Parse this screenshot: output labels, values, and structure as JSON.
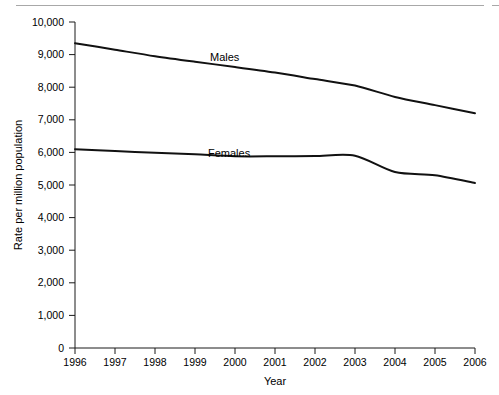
{
  "chart_data": {
    "type": "line",
    "title": "",
    "xlabel": "Year",
    "ylabel": "Rate per million population",
    "x": [
      1996,
      1997,
      1998,
      1999,
      2000,
      2001,
      2002,
      2003,
      2004,
      2005,
      2006
    ],
    "xlim": [
      1996,
      2006
    ],
    "ylim": [
      0,
      10000
    ],
    "ytick_labels": [
      "0",
      "1,000",
      "2,000",
      "3,000",
      "4,000",
      "5,000",
      "6,000",
      "7,000",
      "8,000",
      "9,000",
      "10,000"
    ],
    "ytick_values": [
      0,
      1000,
      2000,
      3000,
      4000,
      5000,
      6000,
      7000,
      8000,
      9000,
      10000
    ],
    "xtick_labels": [
      "1996",
      "1997",
      "1998",
      "1999",
      "2000",
      "2001",
      "2002",
      "2003",
      "2004",
      "2005",
      "2006"
    ],
    "grid": false,
    "legend_position": "inline-labels",
    "series": [
      {
        "name": "Males",
        "label": "Males",
        "values": [
          9350,
          9150,
          8950,
          8780,
          8620,
          8450,
          8250,
          8050,
          7700,
          7450,
          7200
        ]
      },
      {
        "name": "Females",
        "label": "Females",
        "values": [
          6100,
          6040,
          5990,
          5940,
          5880,
          5880,
          5890,
          5900,
          5400,
          5300,
          5060
        ]
      }
    ],
    "annotations": [
      {
        "text": "Males",
        "x": 2000.4,
        "y": 9000
      },
      {
        "text": "Females",
        "x": 2000.3,
        "y": 6050
      }
    ]
  }
}
